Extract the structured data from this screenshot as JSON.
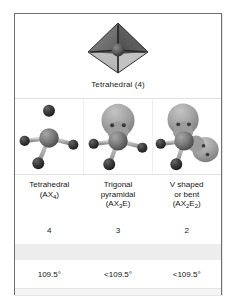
{
  "figure": {
    "title_row": {
      "label": "Tetrahedral (4)",
      "shape_icon": "tetrahedron-icon"
    },
    "columns": [
      {
        "id": "tetrahedral",
        "model_icon": "ball-and-stick-tetrahedral-icon",
        "name_line1": "Tetrahedral",
        "formula_prefix": "(AX",
        "formula_sub1": "4",
        "formula_mid": "",
        "formula_sub2": "",
        "formula_suffix": ")",
        "bonded_atoms": "4",
        "bond_angle": "109.5°",
        "lone_pairs": 0
      },
      {
        "id": "trigonal-pyramidal",
        "model_icon": "ball-and-stick-trigonal-pyramidal-icon",
        "name_line1": "Trigonal",
        "name_line2": "pyramidal",
        "formula_prefix": "(AX",
        "formula_sub1": "3",
        "formula_mid": "E",
        "formula_sub2": "",
        "formula_suffix": ")",
        "bonded_atoms": "3",
        "bond_angle": "<109.5°",
        "lone_pairs": 1
      },
      {
        "id": "v-shaped-bent",
        "model_icon": "ball-and-stick-bent-icon",
        "name_line1": "V shaped",
        "name_line2": "or bent",
        "formula_prefix": "(AX",
        "formula_sub1": "2",
        "formula_mid": "E",
        "formula_sub2": "2",
        "formula_suffix": ")",
        "bonded_atoms": "2",
        "bond_angle": "<109.5°",
        "lone_pairs": 2
      }
    ],
    "colors": {
      "frame_border": "#6e6e6e",
      "page_background": "#ffffff",
      "panel_background": "#fdfdfd",
      "central_atom": "#7b7b7b",
      "terminal_atom": "#3c3c3c",
      "bond": "#b4b4b4",
      "lone_pair_lobe": "#a3a3a3",
      "lone_pair_dot": "#3a3a3a",
      "tetra_face_light": "#cfcfcf",
      "tetra_face_dark": "#6a6a6a",
      "band_gray": "#ededed",
      "text": "#141414"
    }
  }
}
